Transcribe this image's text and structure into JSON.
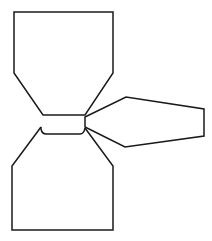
{
  "diagram": {
    "stroke_color": "#1a1a1a",
    "background_color": "#ffffff",
    "shapes": [
      {
        "name": "top-hexagon"
      },
      {
        "name": "right-hexagon"
      },
      {
        "name": "bottom-hexagon"
      },
      {
        "name": "center-connector"
      }
    ]
  }
}
